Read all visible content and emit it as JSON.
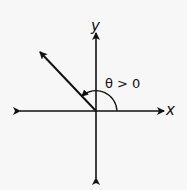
{
  "diagram": {
    "title": "",
    "axes": {
      "x_label": "x",
      "y_label": "y"
    },
    "angle_label": "θ > 0",
    "elements": {
      "origin": [
        96,
        111
      ],
      "x_axis": {
        "from": [
          20,
          111
        ],
        "to": [
          164,
          111
        ],
        "arrows": "both"
      },
      "y_axis": {
        "from": [
          96,
          178
        ],
        "to": [
          96,
          33
        ],
        "arrows": "both"
      },
      "terminal_ray": {
        "from": [
          96,
          111
        ],
        "to": [
          40,
          52
        ],
        "arrow": "end",
        "quadrant": "II"
      },
      "angle_arc": {
        "center": [
          96,
          111
        ],
        "radius": 21,
        "start_deg": 0,
        "end_deg": 133,
        "direction": "counterclockwise",
        "arrow": "end"
      }
    },
    "colors": {
      "background": "#f7f7f7",
      "stroke": "#111111"
    }
  }
}
